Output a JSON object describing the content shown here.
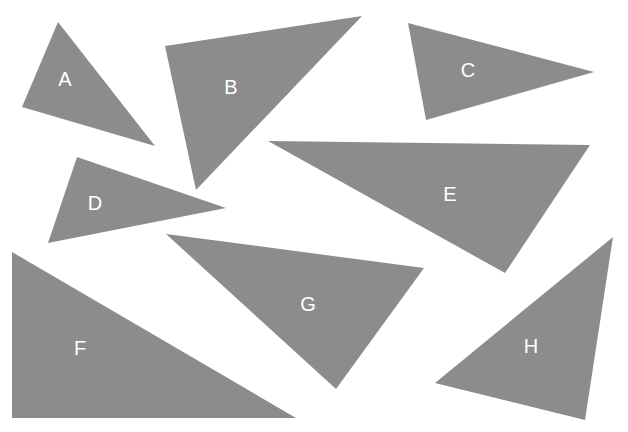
{
  "figure": {
    "background_color": "#ffffff",
    "width": 628,
    "height": 432
  },
  "style": {
    "shape_fill": "#8c8c8c",
    "label_color": "#ffffff",
    "label_font_size": 20
  },
  "chart_data": {
    "type": "diagram",
    "title": "",
    "shape_kind": "triangle",
    "count": 8,
    "labels": [
      "A",
      "B",
      "C",
      "D",
      "E",
      "F",
      "G",
      "H"
    ]
  },
  "shapes": [
    {
      "label": "A",
      "fill": "#8c8c8c",
      "points": "58,22 22,107 155,146",
      "label_x": 65,
      "label_y": 81
    },
    {
      "label": "B",
      "fill": "#8c8c8c",
      "points": "362,16 165,46 196,190",
      "label_x": 231,
      "label_y": 89
    },
    {
      "label": "C",
      "fill": "#8c8c8c",
      "points": "408,23 594,72 426,120",
      "label_x": 468,
      "label_y": 72
    },
    {
      "label": "D",
      "fill": "#8c8c8c",
      "points": "77,157 226,208 48,243",
      "label_x": 95,
      "label_y": 205
    },
    {
      "label": "E",
      "fill": "#8c8c8c",
      "points": "268,141 590,145 505,273",
      "label_x": 450,
      "label_y": 196
    },
    {
      "label": "F",
      "fill": "#8c8c8c",
      "points": "12,252 12,418 296,418",
      "label_x": 80,
      "label_y": 350
    },
    {
      "label": "G",
      "fill": "#8c8c8c",
      "points": "166,234 424,268 336,389",
      "label_x": 308,
      "label_y": 306
    },
    {
      "label": "H",
      "fill": "#8c8c8c",
      "points": "613,237 435,383 585,420",
      "label_x": 531,
      "label_y": 348
    }
  ]
}
